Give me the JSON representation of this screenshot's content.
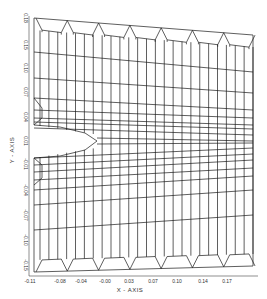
{
  "figure": {
    "type": "finite-element-mesh",
    "xlabel": "X - AXIS",
    "ylabel": "Y - AXIS",
    "x_ticks": [
      "-0.11",
      "-0.08",
      "-0.04",
      "-0.00",
      "0.03",
      "0.07",
      "0.10",
      "0.14",
      "0.17"
    ],
    "y_ticks": [
      "0.18",
      "0.15",
      "0.10",
      "0.07",
      "0.04",
      "0.01",
      "-0.01",
      "-0.04",
      "-0.07",
      "-0.10",
      "-0.15"
    ],
    "caption": "",
    "colors": {
      "line": "#1a1a1a",
      "background": "#ffffff"
    }
  }
}
